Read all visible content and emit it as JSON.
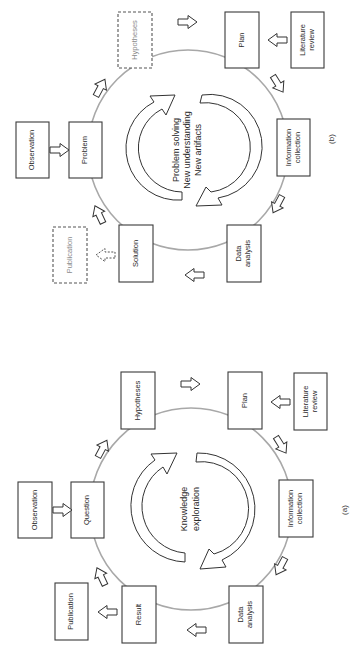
{
  "orientation": "rotated-90-clockwise",
  "diagrams": {
    "b": {
      "figure_label": "(b)",
      "center_lines": [
        "Problem solving",
        "New understanding",
        "New artifacts"
      ],
      "nodes": {
        "observation": {
          "lines": [
            "Observation"
          ]
        },
        "problem": {
          "lines": [
            "Problem"
          ]
        },
        "hypotheses": {
          "lines": [
            "Hypotheses"
          ],
          "style": "dashed"
        },
        "plan": {
          "lines": [
            "Plan"
          ]
        },
        "literature_review": {
          "lines": [
            "Literature",
            "review"
          ]
        },
        "information_collection": {
          "lines": [
            "Information",
            "collection"
          ]
        },
        "data_analysis": {
          "lines": [
            "Data",
            "analysis"
          ]
        },
        "solution": {
          "lines": [
            "Solution"
          ]
        },
        "publication": {
          "lines": [
            "Publication"
          ],
          "style": "dashed"
        }
      }
    },
    "a": {
      "figure_label": "(a)",
      "center_lines": [
        "Knowledge",
        "exploration"
      ],
      "nodes": {
        "observation": {
          "lines": [
            "Observation"
          ]
        },
        "question": {
          "lines": [
            "Question"
          ]
        },
        "hypotheses": {
          "lines": [
            "Hypotheses"
          ]
        },
        "plan": {
          "lines": [
            "Plan"
          ]
        },
        "literature_review": {
          "lines": [
            "Literature",
            "review"
          ]
        },
        "information_collection": {
          "lines": [
            "Information",
            "collection"
          ]
        },
        "data_analysis": {
          "lines": [
            "Data",
            "analysis"
          ]
        },
        "result": {
          "lines": [
            "Result"
          ]
        },
        "publication": {
          "lines": [
            "Publication"
          ]
        }
      }
    }
  },
  "colors": {
    "ring": "#a8a8a8",
    "stroke": "#3a3a3a",
    "faint_text": "#8a8a8a",
    "background": "#ffffff"
  }
}
